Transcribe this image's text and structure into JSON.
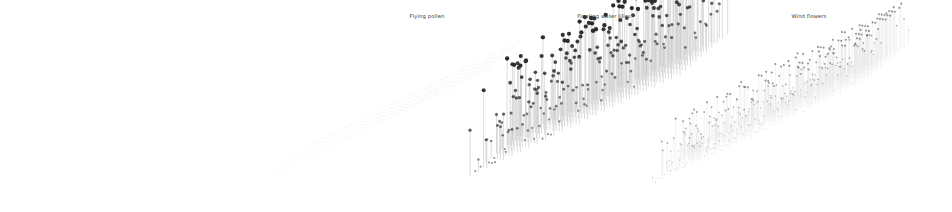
{
  "figure": {
    "width": 952,
    "height": 212,
    "background": "#ffffff",
    "panel_count": 3
  },
  "panels": [
    {
      "key": "flying_pollen",
      "title": "Flying pollen",
      "title_x": 427,
      "title_y": 13
    },
    {
      "key": "floating_water_lilies",
      "title": "Floating water lilies",
      "title_x": 604,
      "title_y": 13
    },
    {
      "key": "wind_flowers",
      "title": "Wind flowers",
      "title_x": 809,
      "title_y": 13
    }
  ],
  "style": {
    "marker_color": "#2b2b2b",
    "stem_color": "#9a9a9a",
    "baseline_color": "#d8d8d8",
    "title_color": "#3a3a3a",
    "background": "#ffffff"
  },
  "chart_data": {
    "type": "scatter",
    "title": "",
    "subtitle": "",
    "xlabel": "",
    "ylabel": "",
    "grid": false,
    "legend": "none",
    "projection": "isometric-3d-stem",
    "panels": [
      {
        "name": "Flying pollen",
        "type": "scatter",
        "grid_nx": 46,
        "grid_ny": 14,
        "origin_x": 272,
        "origin_y": 176,
        "step_ux": 4.6,
        "step_uy": -2.22,
        "step_vx": 3.05,
        "step_vy": -2.58,
        "height_scale": 3.0,
        "value_mean": 0.1,
        "value_max": 0.38,
        "marker_size": 0.62,
        "stem_width": 0.3,
        "opacity": 0.16,
        "seed": 11,
        "note": "Very low amplitude: stems are near zero so the slab reads as a flat translucent grid."
      },
      {
        "name": "Floating water lilies",
        "type": "scatter",
        "grid_nx": 26,
        "grid_ny": 10,
        "origin_x": 470,
        "origin_y": 176,
        "step_ux": 8.4,
        "step_uy": -4.05,
        "step_vx": 5.3,
        "step_vy": -4.5,
        "height_scale": 86.0,
        "value_mean": 0.46,
        "value_max": 1.0,
        "marker_size": 1.95,
        "stem_width": 0.52,
        "opacity": 0.95,
        "seed": 7,
        "note": "Tall stems with large dark round markers; heights trend upward toward the far corner."
      },
      {
        "name": "Wind flowers",
        "type": "scatter",
        "grid_nx": 30,
        "grid_ny": 11,
        "origin_x": 648,
        "origin_y": 186,
        "step_ux": 7.4,
        "step_uy": -3.55,
        "step_vx": 4.6,
        "step_vy": -3.9,
        "height_scale": 44.0,
        "value_mean": 0.4,
        "value_max": 1.0,
        "marker_size": 0.95,
        "stem_width": 0.4,
        "opacity": 0.48,
        "seed": 23,
        "note": "Medium-height thin faint stems with small markers; denser and taller toward the right."
      }
    ]
  }
}
